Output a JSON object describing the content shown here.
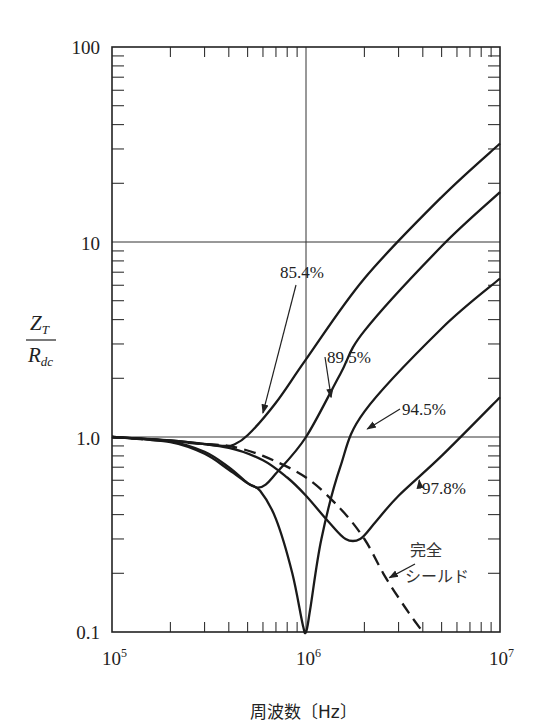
{
  "chart_data": {
    "type": "line",
    "title": "",
    "xlabel": "周波数〔Hz〕",
    "ylabel": "Z_T / R_dc",
    "ylabel_parts": {
      "num": "Z",
      "num_sub": "T",
      "den": "R",
      "den_sub": "dc"
    },
    "xscale": "log",
    "yscale": "log",
    "xlim": [
      100000,
      10000000
    ],
    "ylim": [
      0.1,
      100
    ],
    "grid": "major decades only (10^6 vertical, 1.0 and 10 horizontal)",
    "x_ticks": [
      {
        "value": 100000,
        "label": "10",
        "exp": "5"
      },
      {
        "value": 1000000,
        "label": "10",
        "exp": "6"
      },
      {
        "value": 10000000,
        "label": "10",
        "exp": "7"
      }
    ],
    "y_ticks": [
      {
        "value": 0.1,
        "label": "0.1"
      },
      {
        "value": 1,
        "label": "1.0"
      },
      {
        "value": 10,
        "label": "10"
      },
      {
        "value": 100,
        "label": "100"
      }
    ],
    "series": [
      {
        "name": "85.4%",
        "style": "solid",
        "x": [
          100000,
          200000,
          300000,
          380000,
          420000,
          500000,
          700000,
          1000000,
          2000000,
          5000000,
          10000000
        ],
        "y": [
          1.0,
          0.96,
          0.92,
          0.9,
          0.91,
          1.02,
          1.5,
          2.5,
          6.5,
          17,
          32
        ]
      },
      {
        "name": "89.5%",
        "style": "solid",
        "x": [
          100000,
          200000,
          300000,
          400000,
          500000,
          560000,
          620000,
          700000,
          1000000,
          1500000,
          2000000,
          5000000,
          10000000
        ],
        "y": [
          1.0,
          0.94,
          0.82,
          0.68,
          0.58,
          0.55,
          0.57,
          0.65,
          1.0,
          2.1,
          3.5,
          9.5,
          18
        ]
      },
      {
        "name": "94.5%",
        "style": "solid",
        "x": [
          100000,
          200000,
          300000,
          400000,
          500000,
          580000,
          700000,
          850000,
          960000,
          1000000,
          1050000,
          1200000,
          1500000,
          2000000,
          5000000,
          10000000
        ],
        "y": [
          1.0,
          0.95,
          0.84,
          0.7,
          0.58,
          0.53,
          0.38,
          0.2,
          0.11,
          0.1,
          0.13,
          0.3,
          0.7,
          1.35,
          3.6,
          6.5
        ]
      },
      {
        "name": "97.8%",
        "style": "solid",
        "x": [
          100000,
          200000,
          400000,
          600000,
          800000,
          1000000,
          1300000,
          1600000,
          1900000,
          2300000,
          3000000,
          5000000,
          10000000
        ],
        "y": [
          1.0,
          0.96,
          0.88,
          0.76,
          0.62,
          0.5,
          0.37,
          0.3,
          0.3,
          0.37,
          0.5,
          0.8,
          1.6
        ]
      },
      {
        "name": "完全シールド",
        "style": "dashed",
        "x": [
          100000,
          300000,
          400000,
          600000,
          1000000,
          1500000,
          2000000,
          2500000,
          3000000,
          3500000,
          4000000
        ],
        "y": [
          1.0,
          0.92,
          0.9,
          0.8,
          0.62,
          0.43,
          0.3,
          0.2,
          0.15,
          0.12,
          0.1
        ]
      }
    ],
    "annotations": [
      {
        "text": "85.4%",
        "series": "85.4%",
        "arrow_to": [
          600000,
          1.3
        ]
      },
      {
        "text": "89.5%",
        "series": "89.5%",
        "arrow_to": [
          1300000,
          1.6
        ]
      },
      {
        "text": "94.5%",
        "series": "94.5%",
        "arrow_to": [
          2000000,
          1.1
        ]
      },
      {
        "text": "97.8%",
        "series": "97.8%",
        "arrow_to": [
          3700000,
          0.6
        ]
      },
      {
        "text": "完全",
        "text2": "シールド",
        "series": "完全シールド",
        "arrow_to": [
          2600000,
          0.19
        ]
      }
    ]
  },
  "colors": {
    "line": "#1a1a1a",
    "grid": "#333333",
    "background": "#ffffff"
  }
}
